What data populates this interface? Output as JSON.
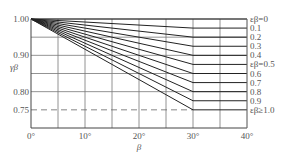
{
  "chart_data": {
    "type": "line",
    "title": "",
    "xlabel": "β",
    "ylabel": "γβ",
    "xlim": [
      0,
      40
    ],
    "ylim": [
      0.7,
      1.0
    ],
    "x_ticks": [
      "0°",
      "10°",
      "20°",
      "30°",
      "40°"
    ],
    "y_ticks": [
      "1.00",
      "0.90",
      "0.80",
      "0.75"
    ],
    "grid": true,
    "reference_line": {
      "y": 0.75,
      "style": "dashed"
    },
    "series": [
      {
        "name": "εβ=0",
        "x": [
          0,
          40
        ],
        "y": [
          1.0,
          1.0
        ]
      },
      {
        "name": "0.1",
        "x": [
          0,
          30,
          40
        ],
        "y": [
          1.0,
          0.975,
          0.975
        ]
      },
      {
        "name": "0.2",
        "x": [
          0,
          30,
          40
        ],
        "y": [
          1.0,
          0.95,
          0.95
        ]
      },
      {
        "name": "0.3",
        "x": [
          0,
          30,
          40
        ],
        "y": [
          1.0,
          0.925,
          0.925
        ]
      },
      {
        "name": "0.4",
        "x": [
          0,
          30,
          40
        ],
        "y": [
          1.0,
          0.9,
          0.9
        ]
      },
      {
        "name": "εβ=0.5",
        "x": [
          0,
          30,
          40
        ],
        "y": [
          1.0,
          0.875,
          0.875
        ]
      },
      {
        "name": "0.6",
        "x": [
          0,
          30,
          40
        ],
        "y": [
          1.0,
          0.85,
          0.85
        ]
      },
      {
        "name": "0.7",
        "x": [
          0,
          30,
          40
        ],
        "y": [
          1.0,
          0.825,
          0.825
        ]
      },
      {
        "name": "0.8",
        "x": [
          0,
          30,
          40
        ],
        "y": [
          1.0,
          0.8,
          0.8
        ]
      },
      {
        "name": "0.9",
        "x": [
          0,
          30,
          40
        ],
        "y": [
          1.0,
          0.775,
          0.775
        ]
      },
      {
        "name": "εβ≥1.0",
        "x": [
          0,
          30,
          40
        ],
        "y": [
          1.0,
          0.75,
          0.75
        ]
      }
    ]
  }
}
